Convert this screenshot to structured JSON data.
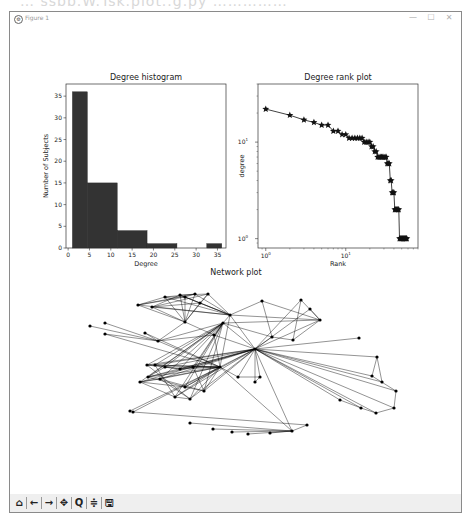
{
  "window": {
    "title": "Figure 1",
    "controls": {
      "minimize": "—",
      "maximize": "☐",
      "close": "✕"
    }
  },
  "background_text": "… ssbb.W.Tsk.plot..g.py ……………",
  "toolbar": {
    "buttons": [
      {
        "name": "home",
        "icon": "home-icon",
        "glyph": "⌂"
      },
      {
        "name": "back",
        "icon": "arrow-left-icon",
        "glyph": "←"
      },
      {
        "name": "forward",
        "icon": "arrow-right-icon",
        "glyph": "→"
      },
      {
        "name": "pan",
        "icon": "move-icon",
        "glyph": "✥"
      },
      {
        "name": "zoom",
        "icon": "magnifier-icon",
        "glyph": "Q"
      },
      {
        "name": "configure-subplots",
        "icon": "sliders-icon",
        "glyph": "≑"
      },
      {
        "name": "save",
        "icon": "floppy-icon",
        "glyph": "🖫"
      }
    ]
  },
  "chart_data": [
    {
      "type": "bar",
      "title": "Degree histogram",
      "xlabel": "Degree",
      "ylabel": "Number of Subjects",
      "xticks": [
        "0",
        "5",
        "10",
        "15",
        "20",
        "25",
        "30",
        "35"
      ],
      "yticks": [
        "0",
        "5",
        "10",
        "15",
        "20",
        "25",
        "30",
        "35"
      ],
      "xlim": [
        -0.5,
        37
      ],
      "ylim": [
        0,
        37.8
      ],
      "bins": [
        {
          "x0": 1.0,
          "x1": 4.5,
          "count": 36
        },
        {
          "x0": 4.5,
          "x1": 11.5,
          "count": 15
        },
        {
          "x0": 11.5,
          "x1": 18.5,
          "count": 4
        },
        {
          "x0": 18.5,
          "x1": 25.5,
          "count": 1
        },
        {
          "x0": 25.5,
          "x1": 32.5,
          "count": 0
        },
        {
          "x0": 32.5,
          "x1": 36.0,
          "count": 1
        }
      ],
      "bar_color": "#333333"
    },
    {
      "type": "line",
      "title": "Degree rank plot",
      "xlabel": "Rank",
      "ylabel": "degree",
      "xscale": "log",
      "yscale": "log",
      "xticks": [
        "10^0",
        "10^1"
      ],
      "yticks": [
        "10^0",
        "10^1"
      ],
      "xlim": [
        0.8,
        80
      ],
      "ylim": [
        0.8,
        40
      ],
      "marker": "star",
      "x": [
        1,
        2,
        3,
        4,
        5,
        6,
        7,
        8,
        9,
        10,
        11,
        12,
        13,
        14,
        15,
        16,
        17,
        18,
        19,
        20,
        21,
        22,
        23,
        24,
        25,
        26,
        27,
        28,
        29,
        30,
        31,
        32,
        33,
        34,
        35,
        36,
        37,
        38,
        39,
        40,
        41,
        42,
        43,
        44,
        45,
        46,
        47,
        48,
        49,
        50,
        51,
        52,
        53,
        54,
        55,
        56,
        57,
        58
      ],
      "y": [
        22,
        19,
        17,
        16,
        15,
        15,
        13,
        13,
        12,
        12,
        11,
        11,
        11,
        11,
        11,
        11,
        10,
        10,
        10,
        10,
        9,
        9,
        8,
        8,
        7,
        7,
        7,
        7,
        7,
        7,
        7,
        7,
        6,
        6,
        6,
        4,
        4,
        3,
        3,
        3,
        2,
        2,
        2,
        2,
        2,
        2,
        1,
        1,
        1,
        1,
        1,
        1,
        1,
        1,
        1,
        1,
        1,
        1
      ]
    },
    {
      "type": "network",
      "title": "Network plot",
      "node_count": 58,
      "node_color": "#000000",
      "edge_color": "#000000"
    }
  ]
}
